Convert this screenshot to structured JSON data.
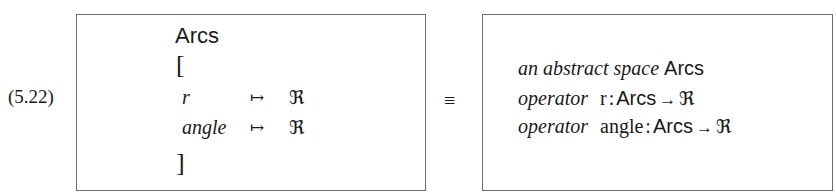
{
  "equation": {
    "number": "(5.22)",
    "equivalence_symbol": "≡",
    "left_box": {
      "title": "Arcs",
      "open_bracket": "[",
      "close_bracket": "]",
      "rows": [
        {
          "name": "r",
          "maps_to": "↦",
          "type": "ℜ"
        },
        {
          "name": "angle",
          "maps_to": "↦",
          "type": "ℜ"
        }
      ]
    },
    "right_box": {
      "lines": [
        {
          "keyword": "an abstract space",
          "name": "Arcs"
        },
        {
          "keyword": "operator",
          "name": "r",
          "colon": ":",
          "domain": "Arcs",
          "arrow": "→",
          "codomain": "ℜ"
        },
        {
          "keyword": "operator",
          "name": "angle",
          "colon": ":",
          "domain": "Arcs",
          "arrow": "→",
          "codomain": "ℜ"
        }
      ]
    }
  }
}
